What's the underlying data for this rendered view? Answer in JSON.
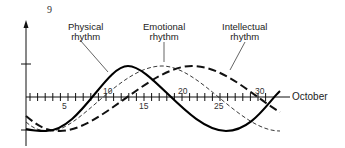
{
  "page_number": "9",
  "chart_data": {
    "type": "line",
    "title": "",
    "xlabel": "October",
    "ylabel": "",
    "x_tick_labels": [
      "5",
      "10",
      "15",
      "20",
      "25",
      "30"
    ],
    "x_range": [
      1,
      32
    ],
    "grid": false,
    "legend_position": "inline annotations",
    "annotations": [
      {
        "text": "Physical rhythm",
        "points_to": "Physical"
      },
      {
        "text": "Emotional rhythm",
        "points_to": "Emotional"
      },
      {
        "text": "Intellectual rhythm",
        "points_to": "Intellectual"
      }
    ],
    "series": [
      {
        "name": "Physical",
        "style": "solid thick",
        "period_days": 23,
        "x": [
          1,
          3,
          9,
          14,
          20,
          26,
          32
        ],
        "y": [
          -0.95,
          -1.0,
          -0.2,
          1.0,
          0.0,
          -1.0,
          0.2
        ]
      },
      {
        "name": "Emotional",
        "style": "thin dashed",
        "period_days": 28,
        "x": [
          1,
          4,
          11,
          18,
          25,
          32
        ],
        "y": [
          -0.75,
          -1.0,
          0.0,
          1.0,
          0.0,
          -1.0
        ]
      },
      {
        "name": "Intellectual",
        "style": "thick dashed",
        "period_days": 33,
        "x": [
          1,
          5,
          13,
          21,
          30,
          32
        ],
        "y": [
          -0.6,
          -1.0,
          0.0,
          1.0,
          0.0,
          -0.4
        ]
      }
    ]
  },
  "labels": {
    "physical_line1": "Physical",
    "physical_line2": "rhythm",
    "emotional_line1": "Emotional",
    "emotional_line2": "rhythm",
    "intellectual_line1": "Intellectual",
    "intellectual_line2": "rhythm",
    "x_axis": "October",
    "ticks": [
      "5",
      "10",
      "15",
      "20",
      "25",
      "30"
    ]
  }
}
